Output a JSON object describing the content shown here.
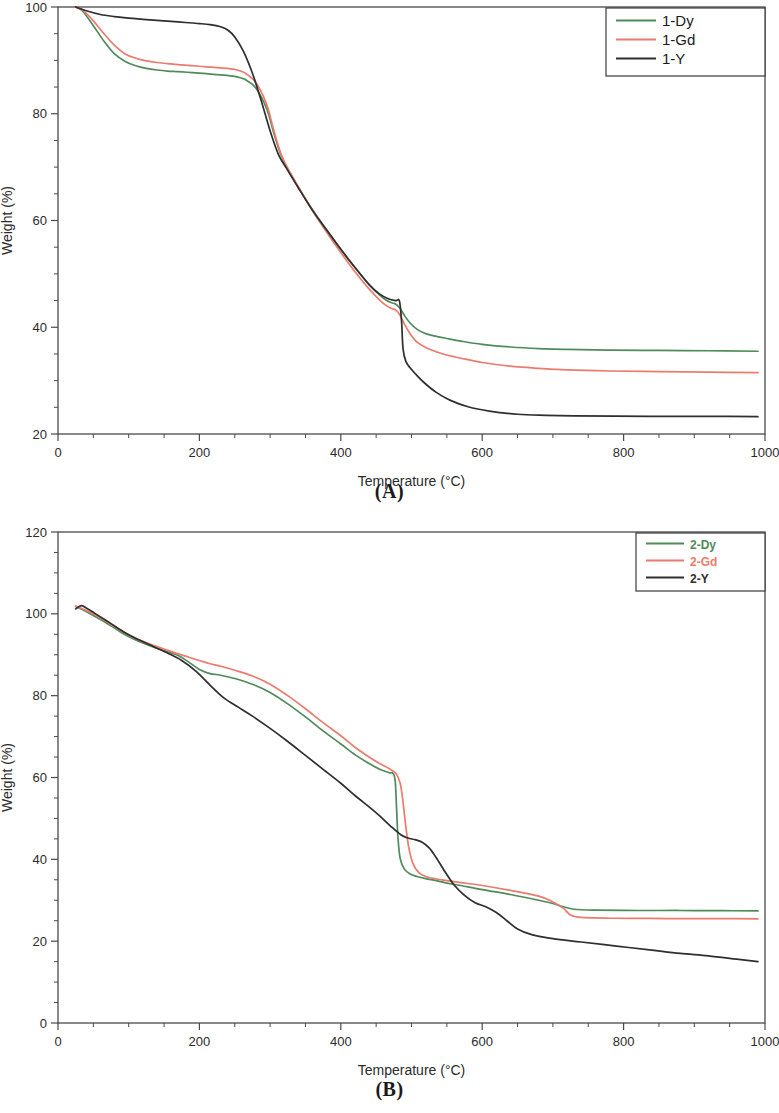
{
  "figure": {
    "panels": [
      {
        "id": "A",
        "caption": "(A)",
        "xlabel": "Temperature (°C)",
        "ylabel": "Weight (%)",
        "legend_text_colored": false
      },
      {
        "id": "B",
        "caption": "(B)",
        "xlabel": "Temperature (°C)",
        "ylabel": "Weight (%)",
        "legend_text_colored": true
      }
    ]
  },
  "colors": {
    "green": "#4f8a5b",
    "red": "#ea7b6e",
    "black": "#2e2e2e",
    "axis": "#4a4a4a",
    "background": "#ffffff"
  },
  "chart_data": [
    {
      "type": "line",
      "title": "",
      "panel": "A",
      "xlabel": "Temperature (°C)",
      "ylabel": "Weight (%)",
      "xlim": [
        0,
        1000
      ],
      "ylim": [
        20,
        100
      ],
      "xticks": [
        0,
        200,
        400,
        600,
        800,
        1000
      ],
      "yticks": [
        20,
        40,
        60,
        80,
        100
      ],
      "xtick_labels": [
        "0",
        "200",
        "400",
        "600",
        "800",
        "1000"
      ],
      "ytick_labels": [
        "20",
        "40",
        "60",
        "80",
        "100"
      ],
      "x_minor_step": 50,
      "y_minor_step": 5,
      "grid": false,
      "legend_position": "top-right",
      "series": [
        {
          "name": "1-Dy",
          "color": "#4f8a5b",
          "x": [
            25,
            35,
            50,
            65,
            80,
            95,
            110,
            125,
            140,
            155,
            170,
            190,
            210,
            230,
            250,
            265,
            280,
            295,
            305,
            315,
            325,
            340,
            360,
            380,
            400,
            420,
            440,
            455,
            465,
            472,
            478,
            484,
            490,
            498,
            508,
            520,
            535,
            550,
            570,
            600,
            640,
            680,
            720,
            780,
            850,
            920,
            990
          ],
          "y": [
            100.0,
            99.2,
            96.5,
            93.6,
            91.2,
            89.8,
            89.0,
            88.5,
            88.2,
            88.0,
            87.9,
            87.7,
            87.5,
            87.3,
            87.0,
            86.4,
            84.8,
            81.0,
            76.5,
            72.4,
            69.6,
            66.2,
            62.0,
            58.2,
            54.6,
            51.2,
            48.0,
            46.0,
            45.0,
            44.6,
            44.3,
            43.5,
            42.2,
            40.8,
            39.6,
            38.8,
            38.3,
            37.9,
            37.4,
            36.8,
            36.3,
            36.0,
            35.85,
            35.7,
            35.65,
            35.6,
            35.5
          ]
        },
        {
          "name": "1-Gd",
          "color": "#ea7b6e",
          "x": [
            25,
            35,
            50,
            65,
            80,
            95,
            110,
            125,
            140,
            155,
            170,
            190,
            210,
            230,
            250,
            265,
            280,
            295,
            305,
            315,
            325,
            340,
            360,
            380,
            400,
            420,
            440,
            455,
            465,
            472,
            478,
            484,
            490,
            498,
            508,
            520,
            535,
            550,
            570,
            600,
            640,
            680,
            720,
            780,
            850,
            920,
            990
          ],
          "y": [
            100.0,
            99.4,
            97.4,
            95.0,
            92.8,
            91.2,
            90.4,
            89.9,
            89.6,
            89.4,
            89.2,
            89.0,
            88.8,
            88.6,
            88.3,
            87.6,
            85.8,
            81.8,
            77.0,
            72.6,
            69.8,
            66.3,
            61.8,
            57.8,
            54.0,
            50.4,
            47.2,
            45.1,
            44.0,
            43.5,
            43.2,
            42.2,
            40.6,
            38.8,
            37.2,
            36.2,
            35.4,
            34.8,
            34.2,
            33.4,
            32.7,
            32.3,
            32.0,
            31.8,
            31.7,
            31.6,
            31.5
          ]
        },
        {
          "name": "1-Y",
          "color": "#2e2e2e",
          "x": [
            25,
            40,
            60,
            80,
            100,
            120,
            140,
            160,
            180,
            200,
            215,
            230,
            240,
            250,
            262,
            275,
            288,
            300,
            312,
            325,
            340,
            360,
            380,
            400,
            420,
            440,
            455,
            468,
            478,
            483,
            486,
            488,
            492,
            498,
            506,
            518,
            535,
            555,
            580,
            610,
            650,
            690,
            730,
            790,
            860,
            930,
            990
          ],
          "y": [
            100.0,
            99.3,
            98.6,
            98.2,
            97.9,
            97.7,
            97.5,
            97.3,
            97.1,
            96.9,
            96.7,
            96.3,
            95.7,
            94.4,
            91.8,
            87.6,
            82.2,
            76.8,
            72.3,
            69.4,
            66.1,
            61.9,
            58.2,
            54.6,
            51.2,
            48.0,
            46.2,
            45.3,
            45.0,
            44.9,
            41.0,
            36.0,
            33.6,
            32.4,
            31.2,
            29.6,
            27.8,
            26.3,
            25.1,
            24.3,
            23.7,
            23.5,
            23.4,
            23.35,
            23.3,
            23.3,
            23.25
          ]
        }
      ]
    },
    {
      "type": "line",
      "title": "",
      "panel": "B",
      "xlabel": "Temperature (°C)",
      "ylabel": "Weight (%)",
      "xlim": [
        0,
        1000
      ],
      "ylim": [
        0,
        120
      ],
      "xticks": [
        0,
        200,
        400,
        600,
        800,
        1000
      ],
      "yticks": [
        0,
        20,
        40,
        60,
        80,
        100,
        120
      ],
      "xtick_labels": [
        "0",
        "200",
        "400",
        "600",
        "800",
        "1000"
      ],
      "ytick_labels": [
        "0",
        "20",
        "40",
        "60",
        "80",
        "100",
        "120"
      ],
      "x_minor_step": 50,
      "y_minor_step": 5,
      "grid": false,
      "legend_position": "top-right",
      "series": [
        {
          "name": "2-Dy",
          "color": "#4f8a5b",
          "x": [
            25,
            35,
            50,
            70,
            90,
            110,
            130,
            150,
            170,
            185,
            200,
            215,
            230,
            250,
            275,
            300,
            325,
            350,
            375,
            400,
            420,
            440,
            455,
            468,
            474,
            477,
            479,
            481,
            484,
            490,
            498,
            508,
            520,
            535,
            550,
            570,
            600,
            640,
            680,
            700,
            715,
            730,
            760,
            820,
            880,
            940,
            990
          ],
          "y": [
            101.8,
            101.0,
            99.6,
            97.6,
            95.4,
            93.6,
            92.2,
            91.0,
            89.8,
            88.2,
            86.4,
            85.4,
            85.0,
            84.2,
            82.8,
            80.8,
            78.0,
            74.8,
            71.4,
            68.2,
            65.6,
            63.4,
            62.0,
            61.2,
            61.0,
            59.0,
            52.0,
            45.0,
            40.2,
            37.6,
            36.4,
            35.8,
            35.3,
            34.8,
            34.2,
            33.6,
            32.6,
            31.4,
            30.0,
            29.2,
            28.4,
            27.8,
            27.6,
            27.5,
            27.5,
            27.45,
            27.4
          ]
        },
        {
          "name": "2-Gd",
          "color": "#ea7b6e",
          "x": [
            25,
            35,
            50,
            70,
            90,
            110,
            130,
            150,
            170,
            185,
            200,
            215,
            230,
            250,
            275,
            300,
            325,
            350,
            375,
            400,
            420,
            440,
            455,
            468,
            478,
            484,
            488,
            492,
            496,
            502,
            510,
            520,
            535,
            550,
            570,
            600,
            640,
            680,
            700,
            715,
            725,
            740,
            780,
            840,
            900,
            950,
            990
          ],
          "y": [
            101.9,
            101.2,
            100.0,
            98.0,
            95.8,
            94.0,
            92.6,
            91.4,
            90.2,
            89.4,
            88.6,
            87.8,
            87.2,
            86.2,
            84.8,
            82.8,
            80.0,
            76.8,
            73.4,
            70.2,
            67.4,
            65.0,
            63.4,
            62.2,
            61.0,
            58.6,
            54.0,
            48.0,
            43.0,
            39.0,
            36.8,
            35.8,
            35.2,
            34.8,
            34.3,
            33.6,
            32.4,
            31.0,
            29.6,
            28.0,
            26.4,
            25.8,
            25.6,
            25.55,
            25.5,
            25.5,
            25.45
          ]
        },
        {
          "name": "2-Y",
          "color": "#2e2e2e",
          "x": [
            25,
            33,
            40,
            55,
            75,
            95,
            115,
            135,
            155,
            175,
            195,
            215,
            235,
            255,
            275,
            300,
            325,
            350,
            375,
            400,
            420,
            440,
            455,
            470,
            485,
            495,
            505,
            515,
            525,
            535,
            548,
            560,
            575,
            590,
            605,
            620,
            635,
            650,
            670,
            700,
            740,
            790,
            840,
            880,
            920,
            960,
            990
          ],
          "y": [
            101.2,
            102.0,
            101.4,
            99.8,
            97.6,
            95.4,
            93.6,
            92.0,
            90.4,
            88.6,
            86.0,
            82.6,
            79.4,
            77.2,
            75.0,
            72.0,
            68.8,
            65.4,
            62.0,
            58.6,
            55.6,
            52.8,
            50.6,
            48.2,
            46.0,
            45.2,
            44.8,
            44.2,
            42.8,
            40.4,
            36.8,
            33.8,
            31.2,
            29.4,
            28.4,
            27.0,
            25.0,
            23.0,
            21.6,
            20.6,
            19.8,
            18.8,
            17.8,
            17.0,
            16.4,
            15.6,
            15.0
          ]
        }
      ]
    }
  ]
}
